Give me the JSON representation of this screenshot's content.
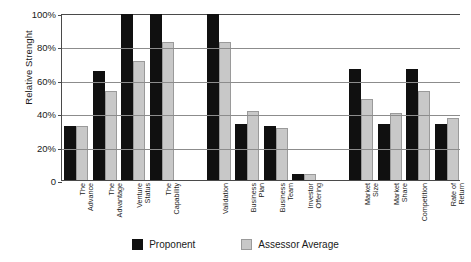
{
  "chart_data": {
    "type": "bar",
    "title": "",
    "xlabel": "",
    "ylabel": "Relative Strenght",
    "ylim": [
      0,
      100
    ],
    "ytick_labels": [
      "0",
      "20%",
      "40%",
      "60%",
      "80%",
      "100%"
    ],
    "ytick_values": [
      0,
      20,
      40,
      60,
      80,
      100
    ],
    "grid": true,
    "legend_position": "bottom-center",
    "categories": [
      "The Advance",
      "The Advantage",
      "Venture Status",
      "The Capability",
      "Validation",
      "Business Plan",
      "Business Team",
      "Investor Offering",
      "Market Size",
      "Market Share",
      "Competition",
      "Rate of Return"
    ],
    "category_lines": [
      [
        "The",
        "Advance"
      ],
      [
        "The",
        "Advantage"
      ],
      [
        "Venture",
        "Status"
      ],
      [
        "The",
        "Capability"
      ],
      [
        "Validation"
      ],
      [
        "Business",
        "Plan"
      ],
      [
        "Business",
        "Team"
      ],
      [
        "Investor",
        "Offering"
      ],
      [
        "Market",
        "Size"
      ],
      [
        "Market",
        "Share"
      ],
      [
        "Competition"
      ],
      [
        "Rate of",
        "Return"
      ]
    ],
    "group_breaks": [
      4,
      8
    ],
    "series": [
      {
        "name": "Proponent",
        "color": "#101010",
        "values": [
          33,
          66,
          100,
          100,
          100,
          34,
          33,
          4,
          67,
          34,
          67,
          34
        ]
      },
      {
        "name": "Assessor Average",
        "color": "#c8c8c8",
        "values": [
          33,
          54,
          72,
          83,
          83,
          42,
          32,
          4,
          49,
          41,
          54,
          38
        ]
      }
    ]
  },
  "legend": {
    "items": [
      {
        "label": "Proponent"
      },
      {
        "label": "Assessor Average"
      }
    ]
  }
}
